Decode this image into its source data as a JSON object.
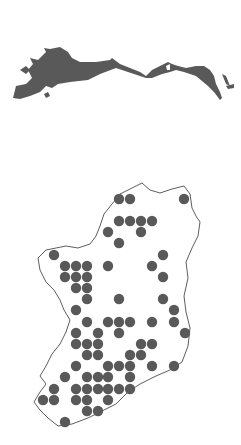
{
  "colors": {
    "fill": "#595959",
    "outline": "#333333",
    "background": "#ffffff"
  },
  "range_map": {
    "label": "eurasia-range-map"
  },
  "distribution_map": {
    "label": "ireland-distribution-map",
    "dot_radius": 5.2,
    "dots": [
      [
        119,
        199
      ],
      [
        130,
        199
      ],
      [
        184,
        199
      ],
      [
        119,
        221
      ],
      [
        130,
        221
      ],
      [
        141,
        221
      ],
      [
        152,
        221
      ],
      [
        108,
        232
      ],
      [
        141,
        232
      ],
      [
        119,
        243
      ],
      [
        54,
        255
      ],
      [
        163,
        255
      ],
      [
        65,
        266
      ],
      [
        76,
        266
      ],
      [
        87,
        266
      ],
      [
        108,
        266
      ],
      [
        152,
        266
      ],
      [
        65,
        277
      ],
      [
        76,
        277
      ],
      [
        87,
        277
      ],
      [
        163,
        277
      ],
      [
        76,
        288
      ],
      [
        87,
        288
      ],
      [
        87,
        299
      ],
      [
        119,
        299
      ],
      [
        163,
        299
      ],
      [
        76,
        310
      ],
      [
        174,
        310
      ],
      [
        87,
        322
      ],
      [
        108,
        322
      ],
      [
        119,
        322
      ],
      [
        130,
        322
      ],
      [
        152,
        322
      ],
      [
        174,
        322
      ],
      [
        76,
        333
      ],
      [
        98,
        333
      ],
      [
        119,
        333
      ],
      [
        185,
        333
      ],
      [
        76,
        344
      ],
      [
        87,
        344
      ],
      [
        98,
        344
      ],
      [
        141,
        344
      ],
      [
        152,
        344
      ],
      [
        87,
        355
      ],
      [
        98,
        355
      ],
      [
        130,
        355
      ],
      [
        141,
        355
      ],
      [
        76,
        366
      ],
      [
        108,
        366
      ],
      [
        119,
        366
      ],
      [
        130,
        366
      ],
      [
        152,
        366
      ],
      [
        174,
        366
      ],
      [
        65,
        377
      ],
      [
        87,
        377
      ],
      [
        98,
        377
      ],
      [
        108,
        377
      ],
      [
        130,
        377
      ],
      [
        54,
        389
      ],
      [
        76,
        389
      ],
      [
        87,
        389
      ],
      [
        98,
        389
      ],
      [
        108,
        389
      ],
      [
        119,
        389
      ],
      [
        130,
        389
      ],
      [
        43,
        400
      ],
      [
        54,
        400
      ],
      [
        76,
        400
      ],
      [
        87,
        400
      ],
      [
        108,
        400
      ],
      [
        87,
        411
      ],
      [
        98,
        411
      ],
      [
        65,
        422
      ]
    ]
  }
}
